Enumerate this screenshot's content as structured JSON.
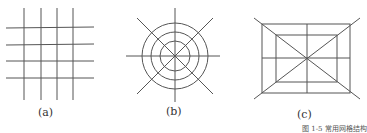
{
  "figures": [
    {
      "id": "a",
      "label": "(a)",
      "type": "rectangular-grid",
      "description": "4 vertical and 4 horizontal intersecting lines"
    },
    {
      "id": "b",
      "label": "(b)",
      "type": "radial-concentric",
      "description": "3 concentric circles with 8 radiating lines"
    },
    {
      "id": "c",
      "label": "(c)",
      "type": "nested-rectangles",
      "description": "2 nested rectangles with center cross and diagonals"
    }
  ],
  "caption": "图 1-5  常用网格结构",
  "colors": {
    "line": "#555555",
    "text": "#333333",
    "background": "#ffffff"
  }
}
